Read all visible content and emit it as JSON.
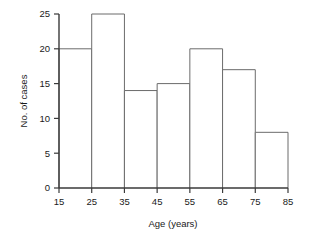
{
  "chart_data": {
    "type": "bar",
    "title": "",
    "subtitle": "",
    "xlabel": "Age (years)",
    "ylabel": "No. of cases",
    "histogram": true,
    "bin_edges": [
      15,
      25,
      35,
      45,
      55,
      65,
      75,
      85
    ],
    "categories": [
      "15-25",
      "25-35",
      "35-45",
      "45-55",
      "55-65",
      "65-75",
      "75-85"
    ],
    "values": [
      20,
      25,
      14,
      15,
      20,
      17,
      8
    ],
    "bin_width": 10,
    "xlim": [
      15,
      85
    ],
    "ylim": [
      0,
      25
    ],
    "xticks": [
      15,
      25,
      35,
      45,
      55,
      65,
      75,
      85
    ],
    "xtick_labels": [
      "15",
      "25",
      "35",
      "45",
      "55",
      "65",
      "75",
      "85"
    ],
    "yticks": [
      0,
      5,
      10,
      15,
      20,
      25
    ],
    "ytick_labels": [
      "0",
      "5",
      "10",
      "15",
      "20",
      "25"
    ],
    "grid": false,
    "legend": false,
    "legend_position": "none",
    "bar_fill": "#ffffff",
    "bar_edge_color": "#6b6b6b",
    "axis_color": "#3a3a3a",
    "background": "#ffffff",
    "annotations": []
  }
}
